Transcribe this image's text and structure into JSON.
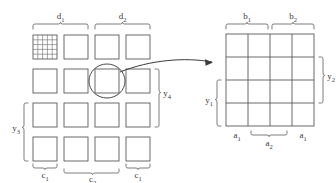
{
  "diagram": {
    "background_color": "#ffffff",
    "line_color": "#555555",
    "label_color": "#3a3a3a"
  },
  "left_panel": {
    "description": "4 by 4 array of separated square blocks; first block contains a fine 5x5 sub-grid",
    "rows": 4,
    "columns": 4,
    "top_labels": [
      {
        "text": "d",
        "sub": "1",
        "spans_columns": [
          1,
          2
        ]
      },
      {
        "text": "d",
        "sub": "2",
        "spans_columns": [
          3,
          4
        ]
      }
    ],
    "bottom_labels": [
      {
        "text": "c",
        "sub": "1",
        "spans_columns": [
          1,
          1
        ]
      },
      {
        "text": "c",
        "sub": "2",
        "spans_columns": [
          2,
          3
        ]
      },
      {
        "text": "c",
        "sub": "1",
        "spans_columns": [
          4,
          4
        ]
      }
    ],
    "left_labels": [
      {
        "text": "y",
        "sub": "3",
        "spans_rows": [
          3,
          4
        ]
      }
    ],
    "right_labels": [
      {
        "text": "y",
        "sub": "4",
        "spans_rows": [
          2,
          3
        ]
      }
    ],
    "highlight": {
      "shape": "ellipse",
      "target_row": 2,
      "target_column": 3
    },
    "detail_block": {
      "row": 1,
      "column": 1,
      "sub_rows": 5,
      "sub_columns": 5
    }
  },
  "right_panel": {
    "description": "Contiguous 4 by 4 grid of cells",
    "rows": 4,
    "columns": 4,
    "top_labels": [
      {
        "text": "b",
        "sub": "1",
        "spans_columns": [
          1,
          2
        ]
      },
      {
        "text": "b",
        "sub": "2",
        "spans_columns": [
          3,
          4
        ]
      }
    ],
    "bottom_labels": [
      {
        "text": "a",
        "sub": "1",
        "spans_columns": [
          1,
          1
        ]
      },
      {
        "text": "a",
        "sub": "2",
        "spans_columns": [
          2,
          3
        ]
      },
      {
        "text": "a",
        "sub": "1",
        "spans_columns": [
          4,
          4
        ]
      }
    ],
    "left_labels": [
      {
        "text": "y",
        "sub": "1",
        "spans_rows": [
          3,
          4
        ]
      }
    ],
    "right_labels": [
      {
        "text": "y",
        "sub": "2",
        "spans_rows": [
          1,
          2
        ]
      }
    ]
  },
  "connector": {
    "type": "curved-arrow",
    "from": "left-panel-highlighted-block",
    "to": "right-panel-left-edge"
  }
}
